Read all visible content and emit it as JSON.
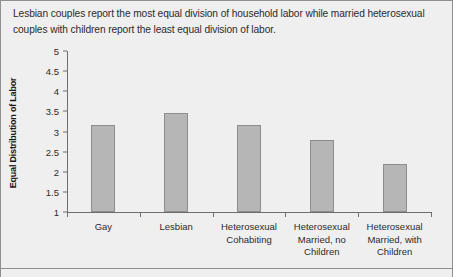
{
  "caption": "Lesbian couples report the most equal division of household labor while married heterosexual couples with children report the least equal division of labor.",
  "chart_data": {
    "type": "bar",
    "title": "",
    "xlabel": "",
    "ylabel": "Equal Distribution of Labor",
    "categories": [
      "Gay",
      "Lesbian",
      "Heterosexual Cohabiting",
      "Heterosexual Married, no Children",
      "Heterosexual Married, with Children"
    ],
    "category_lines": [
      [
        "Gay"
      ],
      [
        "Lesbian"
      ],
      [
        "Heterosexual",
        "Cohabiting"
      ],
      [
        "Heterosexual",
        "Married, no",
        "Children"
      ],
      [
        "Heterosexual",
        "Married, with",
        "Children"
      ]
    ],
    "values": [
      3.15,
      3.45,
      3.15,
      2.8,
      2.2
    ],
    "ylim": [
      1,
      5
    ],
    "ytick_values": [
      1,
      1.5,
      2,
      2.5,
      3,
      3.5,
      4,
      4.5,
      5
    ],
    "ytick_labels": [
      "1",
      "1.5",
      "2",
      "2.5",
      "3",
      "3.5",
      "4",
      "4.5",
      "5"
    ],
    "grid": false,
    "legend": null,
    "bar_color": "#b6b6b6",
    "bar_border_color": "#8d8d8d",
    "axis_color": "#6e6e6e",
    "background_color": "#efefef"
  }
}
